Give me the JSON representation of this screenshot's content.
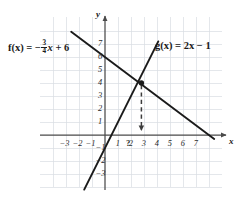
{
  "figure": {
    "background_color": "#ffffff",
    "grid_color": "#d8dde2",
    "axis_color": "#4a4a4a",
    "curve_color": "#1a1a1a"
  },
  "labels": {
    "f_prefix": "f(x) = −",
    "f_numerator": "3",
    "f_denominator": "4",
    "f_suffix_var": "x",
    "f_suffix_rest": " + 6",
    "g_full": "g(x) = 2x − 1",
    "x_axis_name": "x",
    "y_axis_name": "y",
    "unknown_mark": "?"
  },
  "chart_data": {
    "type": "line",
    "title": "",
    "xlabel": "x",
    "ylabel": "y",
    "xlim": [
      -4.2,
      8.9
    ],
    "ylim": [
      -4.4,
      8.3
    ],
    "grid": true,
    "legend": "inline-annotations",
    "x_ticks": [
      -3,
      -2,
      -1,
      1,
      2,
      3,
      4,
      5,
      6,
      7
    ],
    "x_tick_labels": [
      "−3",
      "−2",
      "−1",
      "1",
      "2",
      "3",
      "4",
      "5",
      "6",
      "7"
    ],
    "y_ticks": [
      -3,
      -2,
      -1,
      1,
      2,
      3,
      4,
      5,
      6,
      7
    ],
    "y_tick_labels": [
      "−3",
      "−2",
      "−1",
      "1",
      "2",
      "3",
      "4",
      "5",
      "6",
      "7"
    ],
    "series": [
      {
        "name": "f(x) = -3/4 x + 6",
        "equation": "f(x) = -3/4*x + 6",
        "slope": -0.75,
        "intercept": 6,
        "x_intercept": 8,
        "y_intercept": 6,
        "domain": [
          -2.6,
          8.4
        ],
        "style": "solid"
      },
      {
        "name": "g(x) = 2x - 1",
        "equation": "g(x) = 2*x - 1",
        "slope": 2,
        "intercept": -1,
        "x_intercept": 0.5,
        "y_intercept": -1,
        "domain": [
          -1.6,
          4.1
        ],
        "style": "solid"
      }
    ],
    "annotations": [
      {
        "kind": "intersection-point",
        "x": 2.8,
        "y": 4,
        "marker": "filled-circle"
      },
      {
        "kind": "drop-line",
        "from": [
          2.8,
          4
        ],
        "to": [
          2.8,
          0
        ],
        "style": "dashed",
        "arrow": "down"
      },
      {
        "kind": "unknown-x-label",
        "text": "?",
        "x": 2.62,
        "y": -0.55
      }
    ]
  }
}
